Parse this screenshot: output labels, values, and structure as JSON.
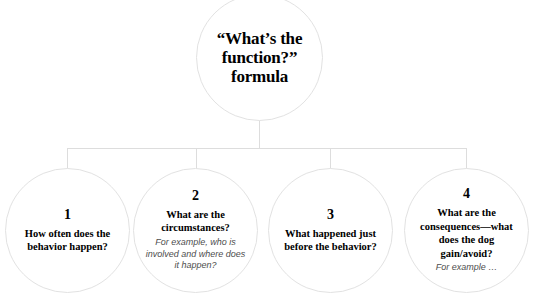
{
  "diagram": {
    "line_color": "#dddddd",
    "circle_border_color": "#e2e2e2",
    "root": {
      "title": "“What’s the function?” formula"
    },
    "children": [
      {
        "number": "1",
        "question": "How often does the behavior happen?",
        "example": ""
      },
      {
        "number": "2",
        "question": "What are the circumstances?",
        "example": "For example, who is involved and where does it happen?"
      },
      {
        "number": "3",
        "question": "What happened just before the behavior?",
        "example": ""
      },
      {
        "number": "4",
        "question": "What are the consequences—what does the dog gain/avoid?",
        "example": "For example …"
      }
    ]
  }
}
